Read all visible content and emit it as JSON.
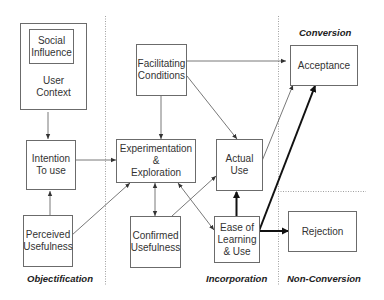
{
  "diagram": {
    "phases": [
      {
        "id": "objectification",
        "label": "Objectification"
      },
      {
        "id": "incorporation",
        "label": "Incorporation"
      },
      {
        "id": "conversion",
        "label": "Conversion"
      },
      {
        "id": "non_conversion",
        "label": "Non-Conversion"
      }
    ],
    "nodes": {
      "social_influence": "Social\nInfluence",
      "user_context": "User\nContext",
      "intention_to_use": "Intention\nTo use",
      "perceived_usefulness": "Perceived\nUsefulness",
      "facilitating_conditions": "Facilitating\nConditions",
      "experimentation_exploration": "Experimentation\n&\nExploration",
      "confirmed_usefulness": "Confirmed\nUsefulness",
      "actual_use": "Actual\nUse",
      "ease_of_learning_use": "Ease of\nLearning\n& Use",
      "acceptance": "Acceptance",
      "rejection": "Rejection"
    },
    "edges": [
      {
        "from": "User Context",
        "to": "Intention To use",
        "weight": "thin"
      },
      {
        "from": "Perceived Usefulness",
        "to": "Intention To use",
        "weight": "thin"
      },
      {
        "from": "Intention To use",
        "to": "Experimentation & Exploration",
        "weight": "thin"
      },
      {
        "from": "Perceived Usefulness",
        "to": "Experimentation & Exploration",
        "weight": "thin"
      },
      {
        "from": "Facilitating Conditions",
        "to": "Experimentation & Exploration",
        "weight": "thin"
      },
      {
        "from": "Facilitating Conditions",
        "to": "Actual Use",
        "weight": "thin"
      },
      {
        "from": "Facilitating Conditions",
        "to": "Acceptance",
        "weight": "thin"
      },
      {
        "from": "Experimentation & Exploration",
        "to": "Confirmed Usefulness",
        "weight": "thin",
        "bidirectional": true
      },
      {
        "from": "Experimentation & Exploration",
        "to": "Ease of Learning & Use",
        "weight": "thin",
        "bidirectional": true
      },
      {
        "from": "Confirmed Usefulness",
        "to": "Actual Use",
        "weight": "thin"
      },
      {
        "from": "Actual Use",
        "to": "Acceptance",
        "weight": "thin"
      },
      {
        "from": "Ease of Learning & Use",
        "to": "Actual Use",
        "weight": "thick"
      },
      {
        "from": "Ease of Learning & Use",
        "to": "Acceptance",
        "weight": "thick"
      },
      {
        "from": "Ease of Learning & Use",
        "to": "Rejection",
        "weight": "thick"
      }
    ]
  }
}
